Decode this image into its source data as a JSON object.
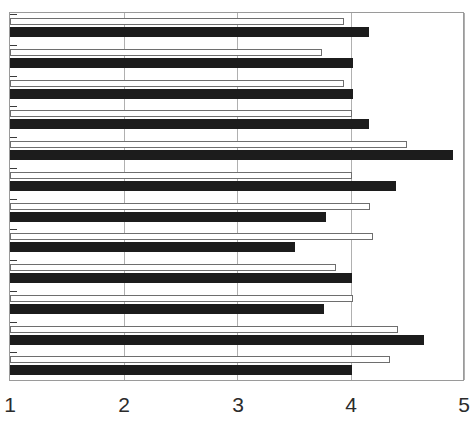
{
  "chart_data": {
    "type": "bar",
    "orientation": "horizontal",
    "title": "",
    "subtitle": "",
    "xlabel": "",
    "ylabel": "",
    "xlim": [
      1,
      5
    ],
    "ylim": null,
    "grid": true,
    "grid_axis": "x",
    "legend": null,
    "legend_position": "none",
    "xticks": [
      1,
      2,
      3,
      4,
      5
    ],
    "xtick_labels": [
      "1",
      "2",
      "3",
      "4",
      "5"
    ],
    "categories": [
      "Item 1",
      "Item 2",
      "Item 3",
      "Item 4",
      "Item 5",
      "Item 6",
      "Item 7",
      "Item 8",
      "Item 9",
      "Item 10",
      "Item 11",
      "Item 12"
    ],
    "series": [
      {
        "name": "Series 1",
        "style": "open",
        "color": "#ffffff",
        "edge_color": "#6e6e6e",
        "values": [
          3.94,
          3.75,
          3.94,
          4.01,
          4.5,
          4.01,
          4.17,
          4.2,
          3.87,
          4.02,
          4.42,
          4.35
        ]
      },
      {
        "name": "Series 2",
        "style": "filled",
        "color": "#1c1c1c",
        "edge_color": "#1c1c1c",
        "values": [
          4.16,
          4.02,
          4.02,
          4.16,
          4.9,
          4.4,
          3.78,
          3.51,
          4.01,
          3.77,
          4.65,
          4.01
        ]
      }
    ]
  },
  "axis": {
    "tick_1": "1",
    "tick_2": "2",
    "tick_3": "3",
    "tick_4": "4",
    "tick_5": "5"
  },
  "colors": {
    "filled_bar": "#1c1c1c",
    "open_bar_fill": "#ffffff",
    "open_bar_edge": "#6e6e6e",
    "gridline": "#b0b0b0",
    "frame": "#9a9a9a",
    "label_text": "#2b2b2b",
    "background": "#ffffff"
  }
}
